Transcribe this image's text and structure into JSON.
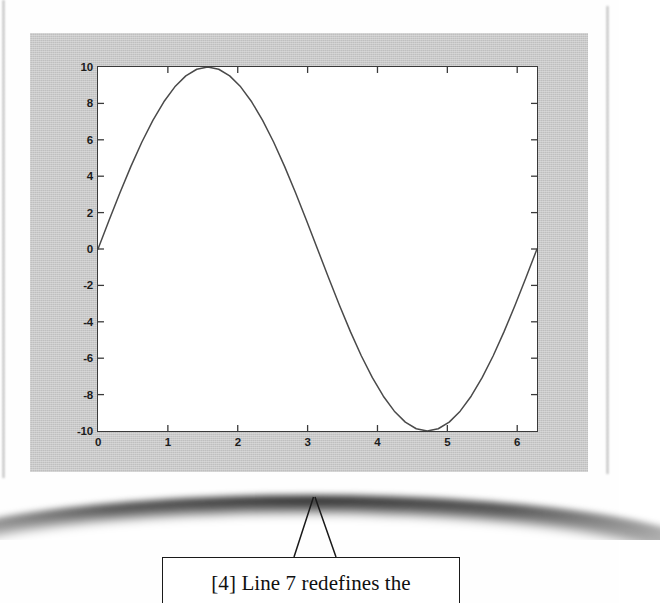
{
  "page": {
    "kind": "scanned-book-page",
    "background_color": "#ffffff"
  },
  "figure": {
    "name": "matlab-figure-window",
    "background_color": "#c9c9c9",
    "axes_background_color": "#ffffff",
    "axes_border_color": "#3a3a3a",
    "line_color": "#4a4a4a"
  },
  "chart_data": {
    "type": "line",
    "title": "",
    "xlabel": "",
    "ylabel": "",
    "xlim": [
      0,
      6.2832
    ],
    "ylim": [
      -10,
      10
    ],
    "xticks": [
      0,
      1,
      2,
      3,
      4,
      5,
      6
    ],
    "xtick_labels": [
      "0",
      "1",
      "2",
      "3",
      "4",
      "5",
      "6"
    ],
    "yticks": [
      -10,
      -8,
      -6,
      -4,
      -2,
      0,
      2,
      4,
      6,
      8,
      10
    ],
    "ytick_labels": [
      "-10",
      "-8",
      "-6",
      "-4",
      "-2",
      "0",
      "2",
      "4",
      "6",
      "8",
      "10"
    ],
    "grid": false,
    "legend": null,
    "series": [
      {
        "name": "10*sin(x)",
        "formula": "y = 10 * sin(x)",
        "color": "#4a4a4a",
        "x": [
          0,
          0.1571,
          0.3142,
          0.4712,
          0.6283,
          0.7854,
          0.9425,
          1.0996,
          1.2566,
          1.4137,
          1.5708,
          1.7279,
          1.885,
          2.042,
          2.1991,
          2.3562,
          2.5133,
          2.6704,
          2.8274,
          2.9845,
          3.1416,
          3.2987,
          3.4558,
          3.6128,
          3.7699,
          3.927,
          4.0841,
          4.2412,
          4.3982,
          4.5553,
          4.7124,
          4.8695,
          5.0265,
          5.1836,
          5.3407,
          5.4978,
          5.6549,
          5.8119,
          5.969,
          6.1261,
          6.2832
        ],
        "y": [
          0,
          1.564,
          3.09,
          4.54,
          5.878,
          7.071,
          8.09,
          8.91,
          9.511,
          9.877,
          10,
          9.877,
          9.511,
          8.91,
          8.09,
          7.071,
          5.878,
          4.54,
          3.09,
          1.564,
          0,
          -1.564,
          -3.09,
          -4.54,
          -5.878,
          -7.071,
          -8.09,
          -8.91,
          -9.511,
          -9.877,
          -10,
          -9.877,
          -9.511,
          -8.91,
          -8.09,
          -7.071,
          -5.878,
          -4.54,
          -3.09,
          -1.564,
          0
        ]
      }
    ]
  },
  "callout": {
    "text": "[4] Line 7 redefines the",
    "border_color": "#1a1a1a"
  }
}
